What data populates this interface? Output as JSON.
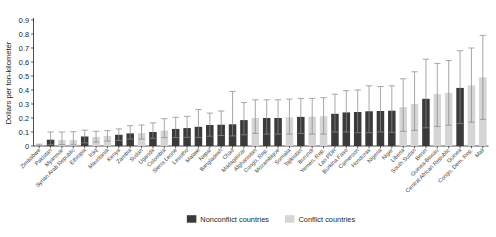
{
  "chart_data": {
    "type": "bar",
    "title": "",
    "xlabel": "",
    "ylabel": "Dollars per ton-kilometer",
    "ylim": [
      0,
      0.9
    ],
    "ytick_labels": [
      "0",
      "0.1",
      "0.2",
      "0.3",
      "0.4",
      "0.5",
      "0.6",
      "0.7",
      "0.8",
      "0.9"
    ],
    "ytick_values": [
      0,
      0.1,
      0.2,
      0.3,
      0.4,
      0.5,
      0.6,
      0.7,
      0.8,
      0.9
    ],
    "grid": false,
    "legend_position": "bottom-center",
    "legend": [
      {
        "name": "Nonconflict countries",
        "color": "#3a3a3a"
      },
      {
        "name": "Conflict countries",
        "color": "#d5d5d5"
      }
    ],
    "categories": [
      "Zimbabwe",
      "Pakistan",
      "Myanmar",
      "Syrian Arab Republic",
      "Ethiopia",
      "Iraq",
      "Mauritania",
      "Kenya",
      "Zambia",
      "Sudan",
      "Uganda",
      "Colombia",
      "Sierra Leone",
      "Lesotho",
      "Malawi",
      "Nepal",
      "Bangladesh",
      "Chad",
      "Madagascar",
      "Afghanistan",
      "Congo, Rep.",
      "Mozambique",
      "Somalia",
      "Tajikistan",
      "Burundi",
      "Yemen, Rep.",
      "Lao PDR",
      "Burkina Faso",
      "Cameroon",
      "Honduras",
      "Nigeria",
      "Niger",
      "Liberia",
      "South Sudan",
      "Benin",
      "Guinea-Bissau",
      "Central African Republic",
      "Guinea",
      "Congo, Dem. Rep.",
      "Mali"
    ],
    "group": [
      "conflict",
      "nonconflict",
      "conflict",
      "conflict",
      "nonconflict",
      "conflict",
      "conflict",
      "nonconflict",
      "nonconflict",
      "conflict",
      "nonconflict",
      "conflict",
      "nonconflict",
      "nonconflict",
      "nonconflict",
      "nonconflict",
      "nonconflict",
      "nonconflict",
      "nonconflict",
      "conflict",
      "nonconflict",
      "nonconflict",
      "conflict",
      "nonconflict",
      "conflict",
      "conflict",
      "nonconflict",
      "nonconflict",
      "nonconflict",
      "nonconflict",
      "nonconflict",
      "nonconflict",
      "conflict",
      "conflict",
      "nonconflict",
      "conflict",
      "conflict",
      "nonconflict",
      "conflict",
      "conflict"
    ],
    "values": [
      0.008,
      0.045,
      0.042,
      0.042,
      0.068,
      0.065,
      0.072,
      0.08,
      0.09,
      0.092,
      0.1,
      0.11,
      0.122,
      0.128,
      0.137,
      0.15,
      0.152,
      0.155,
      0.185,
      0.2,
      0.2,
      0.2,
      0.205,
      0.208,
      0.21,
      0.213,
      0.23,
      0.24,
      0.243,
      0.248,
      0.25,
      0.252,
      0.278,
      0.3,
      0.337,
      0.37,
      0.38,
      0.415,
      0.432,
      0.49
    ],
    "error_low": [
      0.003,
      0.01,
      0.01,
      0.008,
      0.022,
      0.028,
      0.035,
      0.04,
      0.05,
      0.05,
      0.055,
      0.06,
      0.06,
      0.062,
      0.06,
      0.07,
      0.075,
      0.072,
      0.08,
      0.09,
      0.085,
      0.085,
      0.085,
      0.09,
      0.085,
      0.085,
      0.1,
      0.1,
      0.095,
      0.095,
      0.1,
      0.098,
      0.105,
      0.112,
      0.13,
      0.14,
      0.148,
      0.16,
      0.17,
      0.19
    ],
    "error_high": [
      0.013,
      0.1,
      0.1,
      0.102,
      0.113,
      0.105,
      0.11,
      0.122,
      0.145,
      0.15,
      0.165,
      0.195,
      0.205,
      0.212,
      0.26,
      0.235,
      0.25,
      0.39,
      0.31,
      0.33,
      0.33,
      0.33,
      0.335,
      0.34,
      0.34,
      0.345,
      0.37,
      0.395,
      0.4,
      0.43,
      0.425,
      0.43,
      0.48,
      0.53,
      0.62,
      0.59,
      0.61,
      0.68,
      0.7,
      0.79
    ]
  }
}
